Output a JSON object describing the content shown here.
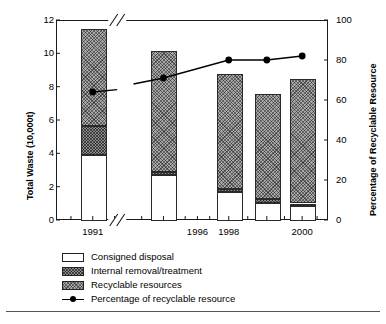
{
  "chart_data": {
    "type": "bar",
    "title": "",
    "subtitle": "",
    "xlabel": "",
    "ylabel": "Total Waste (10,000t)",
    "y2label": "Percentage of Recyclable Resource",
    "ylim": [
      0,
      12
    ],
    "y2lim": [
      0,
      100
    ],
    "yticks": [
      "0",
      "2",
      "4",
      "6",
      "8",
      "10",
      "12"
    ],
    "y2ticks": [
      "0",
      "20",
      "40",
      "60",
      "80",
      "100"
    ],
    "xticklabels": [
      "1991",
      "1996",
      "1998",
      "2000"
    ],
    "axis_break_x": true,
    "axis_break_note": "x-axis broken between 1991 and 1995",
    "grid": false,
    "legend_position": "below-axes-left",
    "categories": [
      "1991",
      "1995",
      "1998",
      "1999",
      "2000"
    ],
    "series": [
      {
        "name": "Consigned disposal",
        "key": "consigned",
        "values": [
          3.95,
          2.75,
          1.75,
          1.1,
          0.9
        ]
      },
      {
        "name": "Internal removal/treatment",
        "key": "internal",
        "values": [
          1.75,
          0.2,
          0.15,
          0.2,
          0.15
        ]
      },
      {
        "name": "Recyclable resources",
        "key": "recyclable",
        "values": [
          5.8,
          7.25,
          6.95,
          6.3,
          7.45
        ]
      }
    ],
    "totals": [
      11.5,
      10.2,
      8.85,
      7.6,
      8.5
    ],
    "line_series": {
      "name": "Percentage of recyclable resource",
      "categories": [
        "1991",
        "1995",
        "1998",
        "1999",
        "2000"
      ],
      "values": [
        64,
        71,
        80,
        80,
        82
      ],
      "marker": "filled-circle",
      "broken_between": [
        "1991",
        "1995"
      ]
    }
  },
  "legend": {
    "items": [
      {
        "label": "Consigned disposal",
        "swatch": "open-white"
      },
      {
        "label": "Internal removal/treatment",
        "swatch": "dense-crosshatch"
      },
      {
        "label": "Recyclable resources",
        "swatch": "light-crosshatch"
      },
      {
        "label": "Percentage of recyclable resource",
        "swatch": "line-marker"
      }
    ]
  },
  "colors": {
    "axis": "#1a1a1a",
    "consigned": "#ffffff",
    "internal": "#8d8d8d",
    "recyclable": "#a8a8a8",
    "line": "#000000",
    "footer_rule": "#555555"
  }
}
